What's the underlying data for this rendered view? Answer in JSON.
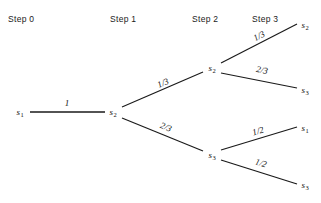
{
  "diagram": {
    "stroke_color": "#1a1a1a",
    "background": "#ffffff",
    "headers": [
      {
        "label": "Step 0",
        "x": 8,
        "y": 14
      },
      {
        "label": "Step 1",
        "x": 110,
        "y": 14
      },
      {
        "label": "Step 2",
        "x": 192,
        "y": 14
      },
      {
        "label": "Step 3",
        "x": 252,
        "y": 14
      }
    ],
    "nodes": [
      {
        "id": "n0",
        "state": "s",
        "index": "1",
        "x": 20,
        "y": 112,
        "step": 0
      },
      {
        "id": "n1",
        "state": "s",
        "index": "2",
        "x": 113,
        "y": 112,
        "step": 1
      },
      {
        "id": "n2u",
        "state": "s",
        "index": "2",
        "x": 212,
        "y": 68,
        "step": 2
      },
      {
        "id": "n2l",
        "state": "s",
        "index": "3",
        "x": 212,
        "y": 155,
        "step": 2
      },
      {
        "id": "n3uu",
        "state": "s",
        "index": "2",
        "x": 305,
        "y": 25,
        "step": 3
      },
      {
        "id": "n3ul",
        "state": "s",
        "index": "3",
        "x": 305,
        "y": 90,
        "step": 3
      },
      {
        "id": "n3lu",
        "state": "s",
        "index": "1",
        "x": 305,
        "y": 128,
        "step": 3
      },
      {
        "id": "n3ll",
        "state": "s",
        "index": "3",
        "x": 305,
        "y": 185,
        "step": 3
      }
    ],
    "edges": [
      {
        "id": "e0",
        "from": "n0",
        "to": "n1",
        "x1": 30,
        "y1": 112,
        "x2": 105,
        "y2": 112,
        "probability": "1",
        "label_x": 67,
        "label_y": 103,
        "angle": 0
      },
      {
        "id": "e1u",
        "from": "n1",
        "to": "n2u",
        "x1": 122,
        "y1": 107,
        "x2": 203,
        "y2": 72,
        "probability": "1/3",
        "label_x": 163,
        "label_y": 83,
        "angle": -23
      },
      {
        "id": "e1l",
        "from": "n1",
        "to": "n2l",
        "x1": 122,
        "y1": 118,
        "x2": 203,
        "y2": 151,
        "probability": "2/3",
        "label_x": 166,
        "label_y": 127,
        "angle": 22
      },
      {
        "id": "e2uu",
        "from": "n2u",
        "to": "n3uu",
        "x1": 221,
        "y1": 63,
        "x2": 297,
        "y2": 24,
        "probability": "1/3",
        "label_x": 259,
        "label_y": 36,
        "angle": -27
      },
      {
        "id": "e2ul",
        "from": "n2u",
        "to": "n3ul",
        "x1": 221,
        "y1": 73,
        "x2": 297,
        "y2": 88,
        "probability": "2/3",
        "label_x": 262,
        "label_y": 70,
        "angle": 11
      },
      {
        "id": "e2lu",
        "from": "n2l",
        "to": "n3lu",
        "x1": 221,
        "y1": 150,
        "x2": 297,
        "y2": 127,
        "probability": "1/2",
        "label_x": 258,
        "label_y": 131,
        "angle": -17
      },
      {
        "id": "e2ll",
        "from": "n2l",
        "to": "n3ll",
        "x1": 221,
        "y1": 160,
        "x2": 297,
        "y2": 184,
        "probability": "1/2",
        "label_x": 261,
        "label_y": 163,
        "angle": 17
      }
    ]
  }
}
